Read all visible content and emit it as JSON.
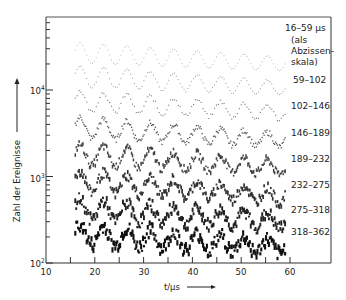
{
  "chart_data": {
    "type": "line",
    "title": "",
    "xlabel": "t/µs",
    "ylabel": "Zahl der Ereignisse",
    "xlim": [
      10,
      68
    ],
    "ylim": [
      100,
      60000
    ],
    "yscale": "log",
    "x_ticks": [
      10,
      20,
      30,
      40,
      50,
      60
    ],
    "x_minor_ticks": [
      15,
      25,
      35,
      45,
      55
    ],
    "y_ticks": [
      {
        "value": 100,
        "label": "10²"
      },
      {
        "value": 1000,
        "label": "10³"
      },
      {
        "value": 10000,
        "label": "10⁴"
      }
    ],
    "grid": false,
    "legend_position": "right-labels",
    "period_us": 4.8,
    "t_range": [
      16,
      59
    ],
    "series": [
      {
        "name": "16–59 µs",
        "note": "(als Abzissen-skala)",
        "start_level": 27000,
        "end_level": 20000,
        "amp_start": 0.12,
        "amp_end": 0.08
      },
      {
        "name": "59–102",
        "start_level": 14500,
        "end_level": 10500,
        "amp_start": 0.12,
        "amp_end": 0.08
      },
      {
        "name": "102–146",
        "start_level": 7500,
        "end_level": 5400,
        "amp_start": 0.12,
        "amp_end": 0.08
      },
      {
        "name": "146–189",
        "start_level": 3700,
        "end_level": 2600,
        "amp_start": 0.12,
        "amp_end": 0.08
      },
      {
        "name": "189–232",
        "start_level": 1800,
        "end_level": 1250,
        "amp_start": 0.12,
        "amp_end": 0.08
      },
      {
        "name": "232–275",
        "start_level": 890,
        "end_level": 590,
        "amp_start": 0.12,
        "amp_end": 0.08
      },
      {
        "name": "275–318",
        "start_level": 420,
        "end_level": 300,
        "amp_start": 0.12,
        "amp_end": 0.08
      },
      {
        "name": "318–362",
        "start_level": 215,
        "end_level": 150,
        "amp_start": 0.12,
        "amp_end": 0.08
      }
    ]
  },
  "labels": {
    "xlabel": "t/µs",
    "ylabel": "Zahl der Ereignisse",
    "x_ticks": [
      "10",
      "20",
      "30",
      "40",
      "50",
      "60"
    ],
    "y10_2": "10",
    "y10_3": "10",
    "y10_4": "10",
    "exp2": "2",
    "exp3": "3",
    "exp4": "4",
    "series": [
      {
        "name": "16–59 µs",
        "note1": "(als",
        "note2": "Abzissen-",
        "note3": "skala)"
      },
      {
        "name": "59–102"
      },
      {
        "name": "102–146"
      },
      {
        "name": "146–189"
      },
      {
        "name": "189–232"
      },
      {
        "name": "232–275"
      },
      {
        "name": "275–318"
      },
      {
        "name": "318–362"
      }
    ]
  }
}
